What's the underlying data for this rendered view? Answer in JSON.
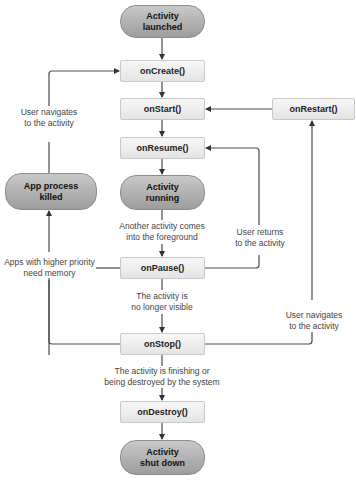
{
  "diagram": {
    "type": "flowchart",
    "nodes": {
      "launched": "Activity\nlaunched",
      "on_create": "onCreate()",
      "on_start": "onStart()",
      "on_restart": "onRestart()",
      "on_resume": "onResume()",
      "running": "Activity\nrunning",
      "on_pause": "onPause()",
      "on_stop": "onStop()",
      "on_destroy": "onDestroy()",
      "shut_down": "Activity\nshut down",
      "process_killed": "App process\nkilled"
    },
    "labels": {
      "user_navigates_left_1": "User navigates",
      "user_navigates_left_2": "to the activity",
      "another_activity_1": "Another activity comes",
      "another_activity_2": "into the foreground",
      "higher_priority_1": "Apps with higher priority",
      "higher_priority_2": "need memory",
      "user_returns_1": "User returns",
      "user_returns_2": "to the activity",
      "no_longer_visible_1": "The activity is",
      "no_longer_visible_2": "no longer visible",
      "user_navigates_right_1": "User navigates",
      "user_navigates_right_2": "to the activity",
      "finishing_1": "The activity is finishing or",
      "finishing_2": "being destroyed by the system"
    },
    "edges": [
      {
        "from": "Activity launched",
        "to": "onCreate()"
      },
      {
        "from": "onCreate()",
        "to": "onStart()"
      },
      {
        "from": "onStart()",
        "to": "onResume()"
      },
      {
        "from": "onResume()",
        "to": "Activity running"
      },
      {
        "from": "Activity running",
        "to": "onPause()",
        "label": "Another activity comes into the foreground"
      },
      {
        "from": "onPause()",
        "to": "onResume()",
        "label": "User returns to the activity"
      },
      {
        "from": "onPause()",
        "to": "App process killed",
        "label": "Apps with higher priority need memory"
      },
      {
        "from": "onPause()",
        "to": "onStop()",
        "label": "The activity is no longer visible"
      },
      {
        "from": "onStop()",
        "to": "App process killed"
      },
      {
        "from": "onStop()",
        "to": "onRestart()",
        "label": "User navigates to the activity"
      },
      {
        "from": "onRestart()",
        "to": "onStart()"
      },
      {
        "from": "onStop()",
        "to": "onDestroy()",
        "label": "The activity is finishing or being destroyed by the system"
      },
      {
        "from": "onDestroy()",
        "to": "Activity shut down"
      },
      {
        "from": "App process killed",
        "to": "onCreate()",
        "label": "User navigates to the activity"
      }
    ],
    "colors": {
      "line": "#4a4a4a",
      "box_fill": "#eeeeee",
      "pill_fill": "#aaaaaa"
    }
  }
}
